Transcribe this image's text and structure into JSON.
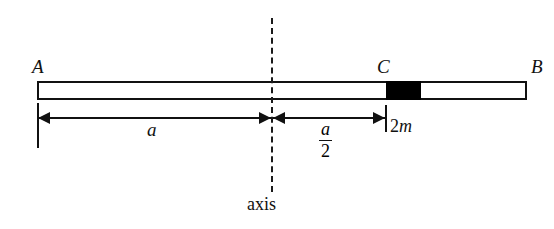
{
  "figure": {
    "caption_text": "axis",
    "points": {
      "left_end": "A",
      "mass_point": "C",
      "right_end": "B"
    },
    "dimensions": {
      "full_label": "a",
      "half_numerator": "a",
      "half_denominator": "2",
      "mass_label_value": "2",
      "mass_label_symbol": "m"
    },
    "colors": {
      "rod_fill": "#ffffff",
      "rod_stroke": "#111111",
      "block_fill": "#000000",
      "axis_stroke": "#1a1a1a",
      "text": "#111111",
      "background": "#ffffff"
    }
  },
  "chart_data": {
    "type": "diagram",
    "title": "",
    "rod": {
      "label_left": "A",
      "label_right": "B",
      "x_left_px": 37,
      "x_right_px": 527,
      "y_top_px": 81,
      "y_bottom_px": 100
    },
    "block": {
      "label": "C",
      "mass": "2m",
      "x_left_px": 386,
      "x_right_px": 421
    },
    "axis": {
      "label": "axis",
      "x_px": 272,
      "y_top_px": 18,
      "y_bottom_px": 192,
      "style": "dashed"
    },
    "measurements": [
      {
        "name": "A-to-axis",
        "label": "a",
        "from": "A",
        "to": "axis"
      },
      {
        "name": "axis-to-C",
        "label": "a/2",
        "from": "axis",
        "to": "C"
      }
    ]
  }
}
